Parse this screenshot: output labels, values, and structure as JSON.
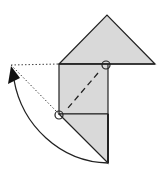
{
  "diagram": {
    "colors": {
      "paper_fill": "#d9d9d9",
      "line": "#222222",
      "background": "#ffffff"
    },
    "elements": {
      "top_triangle": "Upper triangular flap",
      "square": "Central square",
      "bottom_triangle": "Lower triangular flap",
      "fold_line": "Valley fold (dashed)",
      "reference_points": [
        "Top-right corner of square",
        "Bottom-left corner of square"
      ],
      "motion_arrow": "Curved fold arrow",
      "guide_lines": "Dotted guide lines to arrow tip"
    }
  }
}
